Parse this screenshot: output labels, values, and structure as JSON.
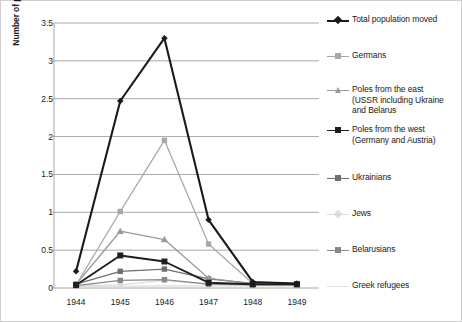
{
  "chart_data": {
    "type": "line",
    "title": "",
    "xlabel": "",
    "ylabel": "Number of people (in millions)",
    "categories": [
      "1944",
      "1945",
      "1946",
      "1947",
      "1948",
      "1949"
    ],
    "ylim": [
      0,
      3.5
    ],
    "ytick_labels": [
      "0",
      "0.5",
      "1",
      "1.5",
      "2",
      "2.5",
      "3",
      "3.5"
    ],
    "ytick_values": [
      0,
      0.5,
      1,
      1.5,
      2,
      2.5,
      3,
      3.5
    ],
    "grid": "horizontal",
    "legend_position": "right",
    "series": [
      {
        "name": "Total population moved",
        "color": "#1a1a1a",
        "marker": "diamond",
        "values": [
          0.22,
          2.47,
          3.3,
          0.9,
          0.08,
          0.06
        ]
      },
      {
        "name": "Germans",
        "color": "#a8a8a8",
        "marker": "square",
        "values": [
          0.04,
          1.01,
          1.95,
          0.58,
          0.06,
          0.05
        ]
      },
      {
        "name": "Poles from the east (USSR including Ukraine and Belarus",
        "name_lines": [
          "Poles from the east",
          "(USSR including Ukraine",
          "and Belarus"
        ],
        "color": "#9a9a9a",
        "marker": "triangle",
        "values": [
          0.05,
          0.75,
          0.64,
          0.13,
          0.05,
          0.05
        ]
      },
      {
        "name": "Poles from the west (Germany and Austria)",
        "name_lines": [
          "Poles from the west",
          "(Germany and Austria)"
        ],
        "color": "#1f1f1f",
        "marker": "square",
        "values": [
          0.04,
          0.43,
          0.35,
          0.07,
          0.05,
          0.05
        ]
      },
      {
        "name": "Ukrainians",
        "color": "#6e6e6e",
        "marker": "square",
        "values": [
          0.05,
          0.22,
          0.25,
          0.12,
          0.06,
          0.05
        ]
      },
      {
        "name": "Jews",
        "color": "#dcdcdc",
        "marker": "diamond",
        "values": [
          0.03,
          0.04,
          0.1,
          0.05,
          0.04,
          0.04
        ]
      },
      {
        "name": "Belarusians",
        "color": "#888888",
        "marker": "square",
        "values": [
          0.03,
          0.1,
          0.11,
          0.05,
          0.04,
          0.04
        ]
      },
      {
        "name": "Greek refugees",
        "color": "#e2e2e2",
        "marker": "none",
        "values": [
          0.02,
          0.02,
          0.03,
          0.03,
          0.03,
          0.03
        ]
      }
    ]
  }
}
